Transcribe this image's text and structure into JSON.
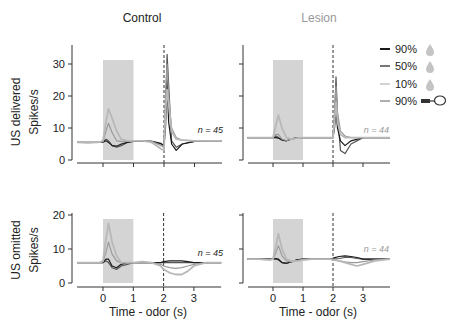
{
  "titles": {
    "control": "Control",
    "lesion": "Lesion"
  },
  "row_labels": {
    "top": "US delivered",
    "bottom": "US omitted"
  },
  "ylabel": "Spikes/s",
  "xlabel": "Time - odor (s)",
  "n_labels": {
    "control": "n = 45",
    "lesion": "n = 44"
  },
  "legend": [
    {
      "label": "90%",
      "icon": "water-drop-icon",
      "color": "#1a1a1a"
    },
    {
      "label": "50%",
      "icon": "water-drop-icon",
      "color": "#555555"
    },
    {
      "label": "10%",
      "icon": "water-drop-icon",
      "color": "#b8b8b8"
    },
    {
      "label": "90%",
      "icon": "cord-loop-icon",
      "color": "#9a9a9a"
    }
  ],
  "colors": {
    "s90": "#1a1a1a",
    "s50": "#555555",
    "s10": "#b8b8b8",
    "s90o": "#9a9a9a",
    "shade": "#d4d4d4",
    "axis": "#333333",
    "lesion_text": "#999999"
  },
  "chart_data": [
    {
      "type": "line",
      "title": "Control",
      "row": "US delivered",
      "ylabel": "Spikes/s",
      "xlim": [
        -0.9,
        3.9
      ],
      "ylim": [
        0,
        35
      ],
      "yticks": [
        0,
        10,
        20,
        30
      ],
      "xticks": [
        0,
        1,
        2,
        3
      ],
      "odor_window": [
        0,
        1
      ],
      "us_time": 2,
      "n": 45,
      "x": [
        -0.85,
        -0.5,
        -0.1,
        0,
        0.1,
        0.18,
        0.3,
        0.45,
        0.6,
        0.8,
        1.0,
        1.3,
        1.6,
        1.9,
        2.0,
        2.05,
        2.1,
        2.15,
        2.25,
        2.4,
        2.6,
        3.0,
        3.4,
        3.9
      ],
      "series": [
        {
          "name": "90%",
          "values": [
            5.5,
            5.6,
            5.6,
            6,
            12,
            16,
            13,
            9,
            6.5,
            6,
            6,
            6,
            5.5,
            3.5,
            3,
            15,
            22,
            18,
            9,
            6.5,
            6.2,
            6,
            6,
            6
          ]
        },
        {
          "name": "50%",
          "values": [
            5.5,
            5.6,
            5.6,
            6,
            9,
            11.5,
            8.5,
            6,
            5.8,
            5.8,
            6,
            6,
            5.8,
            4.5,
            4,
            20,
            30,
            20,
            10,
            7,
            6.2,
            6,
            6,
            6
          ]
        },
        {
          "name": "10%",
          "values": [
            5.5,
            5.5,
            5.5,
            5.8,
            6.5,
            6,
            4.5,
            4,
            4.5,
            5.5,
            6,
            6,
            5.8,
            5,
            4.5,
            16,
            33,
            24,
            6,
            4,
            5,
            5.8,
            6,
            6
          ]
        },
        {
          "name": "90% omitted",
          "values": [
            5.5,
            5.4,
            5.5,
            5.6,
            6,
            5.5,
            4.5,
            4.3,
            5,
            5.5,
            5.8,
            5.8,
            5.8,
            5.2,
            4.5,
            10,
            25,
            12,
            5,
            3,
            5,
            5.8,
            6,
            6
          ]
        }
      ]
    },
    {
      "type": "line",
      "title": "Lesion",
      "row": "US delivered",
      "ylabel": "Spikes/s",
      "xlim": [
        -0.9,
        3.9
      ],
      "ylim": [
        0,
        35
      ],
      "yticks": [
        0,
        10,
        20,
        30
      ],
      "xticks": [
        0,
        1,
        2,
        3
      ],
      "odor_window": [
        0,
        1
      ],
      "us_time": 2,
      "n": 44,
      "x": [
        -0.85,
        -0.5,
        -0.1,
        0,
        0.1,
        0.18,
        0.3,
        0.45,
        0.6,
        0.8,
        1.0,
        1.3,
        1.6,
        1.9,
        2.0,
        2.05,
        2.1,
        2.15,
        2.25,
        2.4,
        2.6,
        3.0,
        3.4,
        3.9
      ],
      "series": [
        {
          "name": "90%",
          "values": [
            7,
            7,
            7,
            7,
            11,
            14,
            10,
            7,
            6.5,
            6.8,
            7,
            7,
            7,
            7,
            7,
            12,
            18,
            12,
            8,
            7,
            7,
            7,
            7,
            7
          ]
        },
        {
          "name": "50%",
          "values": [
            7,
            7,
            7,
            7,
            8,
            8,
            6.5,
            6,
            6.5,
            6.8,
            7,
            7,
            7,
            7,
            7,
            15,
            23,
            15,
            9,
            7.5,
            7,
            7,
            7,
            7
          ]
        },
        {
          "name": "10%",
          "values": [
            7,
            7,
            7,
            7,
            7.5,
            7,
            6.2,
            6,
            6.5,
            7,
            7,
            7,
            7,
            7,
            7,
            13,
            26,
            14,
            3,
            2,
            5,
            7,
            7,
            7
          ]
        },
        {
          "name": "90% omitted",
          "values": [
            7,
            7,
            7,
            7,
            7,
            6.8,
            6.3,
            6,
            6.5,
            7,
            7,
            7,
            7,
            7,
            7,
            10,
            15,
            10,
            6,
            4.5,
            6,
            7,
            7,
            7
          ]
        }
      ]
    },
    {
      "type": "line",
      "title": "Control",
      "row": "US omitted",
      "ylabel": "Spikes/s",
      "xlabel": "Time - odor (s)",
      "xlim": [
        -0.9,
        3.9
      ],
      "ylim": [
        0,
        20
      ],
      "yticks": [
        0,
        10,
        20
      ],
      "xticks": [
        0,
        1,
        2,
        3
      ],
      "odor_window": [
        0,
        1
      ],
      "us_time": 2,
      "n": 45,
      "x": [
        -0.85,
        -0.5,
        -0.1,
        0,
        0.1,
        0.18,
        0.3,
        0.45,
        0.6,
        0.8,
        1.0,
        1.3,
        1.6,
        1.9,
        2.0,
        2.2,
        2.4,
        2.6,
        2.8,
        3.0,
        3.4,
        3.9
      ],
      "series": [
        {
          "name": "90%",
          "values": [
            6,
            6,
            6,
            6.5,
            13,
            17.5,
            12,
            8,
            6,
            6,
            6,
            6.3,
            6,
            5,
            4,
            3,
            2.5,
            2.5,
            3.5,
            5,
            6,
            6
          ]
        },
        {
          "name": "50%",
          "values": [
            6,
            6,
            6,
            6.2,
            9,
            12,
            8.5,
            6.5,
            6,
            6,
            6,
            6,
            6,
            5.5,
            5,
            4.5,
            4.3,
            4.5,
            5,
            5.5,
            6,
            6
          ]
        },
        {
          "name": "10%",
          "values": [
            6,
            6,
            6,
            6,
            6.5,
            6,
            4.5,
            4,
            5,
            5.5,
            6,
            6,
            6,
            6,
            6,
            6,
            6,
            6,
            6,
            6,
            6,
            6
          ]
        },
        {
          "name": "90% omitted",
          "values": [
            6,
            6,
            6,
            6,
            7,
            7,
            5,
            4.5,
            5.5,
            6,
            6,
            6,
            6,
            6,
            6.3,
            6.5,
            6.5,
            6.5,
            6.3,
            6,
            6,
            6
          ]
        }
      ]
    },
    {
      "type": "line",
      "title": "Lesion",
      "row": "US omitted",
      "ylabel": "Spikes/s",
      "xlabel": "Time - odor (s)",
      "xlim": [
        -0.9,
        3.9
      ],
      "ylim": [
        0,
        20
      ],
      "yticks": [
        0,
        10,
        20
      ],
      "xticks": [
        0,
        1,
        2,
        3
      ],
      "odor_window": [
        0,
        1
      ],
      "us_time": 2,
      "n": 44,
      "x": [
        -0.85,
        -0.5,
        -0.1,
        0,
        0.1,
        0.18,
        0.3,
        0.45,
        0.6,
        0.8,
        1.0,
        1.3,
        1.6,
        1.9,
        2.0,
        2.2,
        2.4,
        2.6,
        2.8,
        3.0,
        3.4,
        3.9
      ],
      "series": [
        {
          "name": "90%",
          "values": [
            7,
            7,
            6.8,
            7,
            11,
            14.5,
            10,
            7,
            6.5,
            6.5,
            6.8,
            7,
            7,
            7,
            6.8,
            6.5,
            6,
            5.5,
            5,
            5.5,
            6.5,
            7
          ]
        },
        {
          "name": "50%",
          "values": [
            7,
            7,
            6.8,
            7,
            9,
            11,
            8,
            6.5,
            6.2,
            6.5,
            6.8,
            7,
            7,
            7,
            7,
            6.5,
            6.2,
            6,
            6,
            6.3,
            6.8,
            7
          ]
        },
        {
          "name": "10%",
          "values": [
            7,
            7,
            7,
            7,
            7,
            6.8,
            6,
            5.8,
            6.2,
            6.8,
            7,
            7,
            7,
            7,
            7,
            7.2,
            7.5,
            7.5,
            7.2,
            7,
            7,
            7
          ]
        },
        {
          "name": "90% omitted",
          "values": [
            7,
            7,
            7,
            7,
            7.2,
            7,
            6,
            5.8,
            6.2,
            6.8,
            7,
            7,
            7,
            7,
            7.3,
            7.8,
            8,
            7.8,
            7.5,
            7,
            7,
            7
          ]
        }
      ]
    }
  ]
}
